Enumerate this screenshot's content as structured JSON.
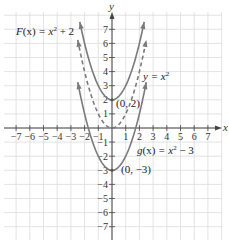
{
  "chart_data": {
    "type": "line",
    "title": "",
    "xlabel": "x",
    "ylabel": "y",
    "xlim": [
      -7.5,
      7.8
    ],
    "ylim": [
      -8,
      8.2
    ],
    "grid": true,
    "x_ticks": [
      -7,
      -6,
      -5,
      -4,
      -3,
      -2,
      -1,
      1,
      2,
      3,
      4,
      5,
      6,
      7
    ],
    "y_ticks": [
      -7,
      -6,
      -5,
      -4,
      -3,
      -2,
      -1,
      1,
      2,
      3,
      4,
      5,
      6,
      7
    ],
    "x_tick_labels": [
      "−7",
      "−6",
      "−5",
      "−4",
      "−3",
      "−2",
      "−1",
      "1",
      "2",
      "3",
      "4",
      "5",
      "6",
      "7"
    ],
    "y_tick_labels": [
      "−7",
      "−6",
      "−5",
      "−4",
      "−3",
      "−2",
      "−1",
      "1",
      "2",
      "3",
      "4",
      "5",
      "6",
      "7"
    ],
    "series": [
      {
        "name": "F(x) = x^2 + 2",
        "formula": "x^2 + 2",
        "shift": 2,
        "x_range": [
          -2.35,
          2.35
        ],
        "style": "solid",
        "color": "#7a7a7a"
      },
      {
        "name": "y = x^2",
        "formula": "x^2",
        "shift": 0,
        "x_range": [
          -2.5,
          2.5
        ],
        "style": "dashed",
        "color": "#7a7a7a"
      },
      {
        "name": "g(x) = x^2 - 3",
        "formula": "x^2 - 3",
        "shift": -3,
        "x_range": [
          -2.5,
          2.5
        ],
        "style": "solid",
        "color": "#7a7a7a"
      }
    ],
    "annotations": [
      {
        "id": "F",
        "text_main": "F",
        "text_paren": "(x)",
        "text_eq": " = x",
        "text_sup": "2",
        "text_tail": " + 2"
      },
      {
        "id": "y",
        "text_main": "y",
        "text_eq": " = x",
        "text_sup": "2"
      },
      {
        "id": "g",
        "text_main": "g",
        "text_paren": "(x)",
        "text_eq": " = x",
        "text_sup": "2",
        "text_tail": " − 3"
      },
      {
        "id": "vertexF",
        "text": "(0, 2)",
        "point": [
          0,
          2
        ]
      },
      {
        "id": "vertexG",
        "text": "(0, −3)",
        "point": [
          0,
          -3
        ]
      }
    ]
  }
}
